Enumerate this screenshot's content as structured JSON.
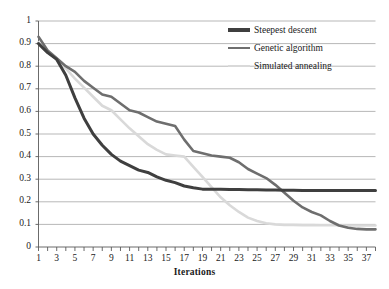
{
  "chart_data": {
    "type": "line",
    "title": "",
    "xlabel": "Iterations",
    "ylabel": "",
    "xlim": [
      1,
      38
    ],
    "ylim": [
      0,
      1
    ],
    "grid": "horizontal",
    "legend_position": "top-right",
    "x": [
      1,
      2,
      3,
      4,
      5,
      6,
      7,
      8,
      9,
      10,
      11,
      12,
      13,
      14,
      15,
      16,
      17,
      18,
      19,
      20,
      21,
      22,
      23,
      24,
      25,
      26,
      27,
      28,
      29,
      30,
      31,
      32,
      33,
      34,
      35,
      36,
      37,
      38
    ],
    "xtick_labels": [
      "1",
      "3",
      "5",
      "7",
      "9",
      "11",
      "13",
      "15",
      "17",
      "19",
      "21",
      "23",
      "25",
      "27",
      "29",
      "31",
      "33",
      "35",
      "37"
    ],
    "xtick_values": [
      1,
      3,
      5,
      7,
      9,
      11,
      13,
      15,
      17,
      19,
      21,
      23,
      25,
      27,
      29,
      31,
      33,
      35,
      37
    ],
    "ytick_labels": [
      "0",
      "0.1",
      "0.2",
      "0.3",
      "0.4",
      "0.5",
      "0.6",
      "0.7",
      "0.8",
      "0.9",
      "1"
    ],
    "ytick_values": [
      0,
      0.1,
      0.2,
      0.3,
      0.4,
      0.5,
      0.6,
      0.7,
      0.8,
      0.9,
      1
    ],
    "series": [
      {
        "name": "Steepest descent",
        "color": "#3f3f3f",
        "width": 3.0,
        "values": [
          0.9,
          0.86,
          0.83,
          0.76,
          0.66,
          0.57,
          0.5,
          0.45,
          0.41,
          0.38,
          0.36,
          0.34,
          0.33,
          0.31,
          0.295,
          0.285,
          0.27,
          0.262,
          0.256,
          0.255,
          0.255,
          0.254,
          0.254,
          0.253,
          0.253,
          0.252,
          0.252,
          0.251,
          0.251,
          0.25,
          0.25,
          0.25,
          0.25,
          0.25,
          0.25,
          0.25,
          0.25,
          0.25
        ]
      },
      {
        "name": "Genetic algorithm",
        "color": "#6e6e6e",
        "width": 2.6,
        "values": [
          0.93,
          0.87,
          0.835,
          0.8,
          0.775,
          0.735,
          0.705,
          0.675,
          0.665,
          0.635,
          0.605,
          0.595,
          0.575,
          0.555,
          0.545,
          0.535,
          0.475,
          0.425,
          0.415,
          0.405,
          0.4,
          0.395,
          0.375,
          0.345,
          0.325,
          0.305,
          0.275,
          0.24,
          0.205,
          0.175,
          0.155,
          0.14,
          0.115,
          0.095,
          0.085,
          0.08,
          0.078,
          0.078
        ]
      },
      {
        "name": "Simulated annealing",
        "color": "#d9d9d9",
        "width": 2.6,
        "values": [
          0.905,
          0.865,
          0.83,
          0.79,
          0.745,
          0.705,
          0.665,
          0.625,
          0.605,
          0.565,
          0.525,
          0.49,
          0.455,
          0.43,
          0.41,
          0.405,
          0.4,
          0.355,
          0.31,
          0.265,
          0.22,
          0.185,
          0.155,
          0.13,
          0.115,
          0.105,
          0.1,
          0.098,
          0.098,
          0.097,
          0.097,
          0.096,
          0.096,
          0.096,
          0.095,
          0.095,
          0.095,
          0.095
        ]
      }
    ]
  }
}
